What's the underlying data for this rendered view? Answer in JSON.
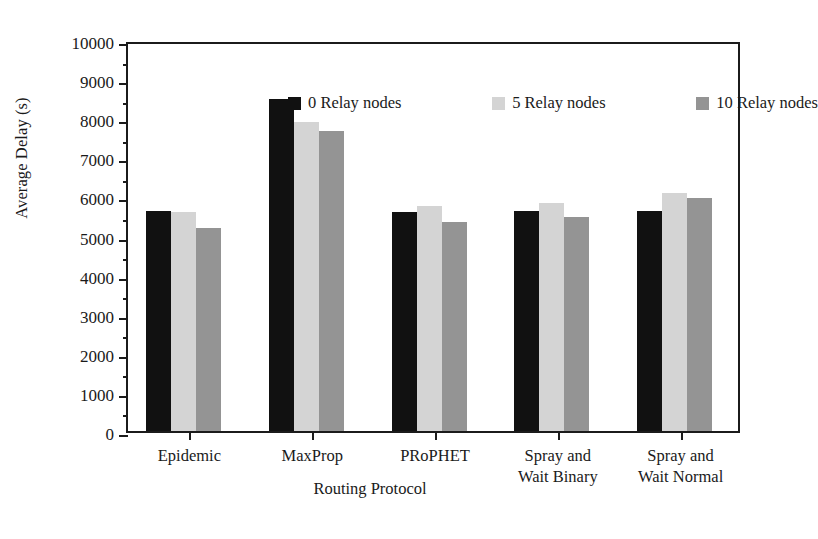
{
  "chart_data": {
    "type": "bar",
    "title": "",
    "xlabel": "Routing Protocol",
    "ylabel": "Average Delay (s)",
    "categories": [
      "Epidemic",
      "MaxProp",
      "PRoPHET",
      "Spray and\nWait Binary",
      "Spray and\nWait Normal"
    ],
    "series": [
      {
        "name": "0 Relay nodes",
        "color": "#111111",
        "values": [
          5620,
          8500,
          5600,
          5620,
          5620
        ]
      },
      {
        "name": "5 Relay nodes",
        "color": "#d4d4d4",
        "values": [
          5590,
          7900,
          5760,
          5840,
          6100
        ]
      },
      {
        "name": "10 Relay nodes",
        "color": "#949494",
        "values": [
          5200,
          7680,
          5340,
          5480,
          5950
        ]
      }
    ],
    "ylim": [
      0,
      10000
    ],
    "ytick_step": 1000,
    "yminor_step": 500,
    "ytick_labels": [
      "0",
      "1000",
      "2000",
      "3000",
      "4000",
      "5000",
      "6000",
      "7000",
      "8000",
      "9000",
      "10000"
    ],
    "grid": false,
    "legend_position": "top-inside"
  },
  "axes": {
    "y_title": "Average Delay (s)",
    "x_title": "Routing Protocol"
  },
  "legend": {
    "items": [
      {
        "label": "0 Relay nodes"
      },
      {
        "label": "5 Relay nodes"
      },
      {
        "label": "10 Relay nodes"
      }
    ]
  }
}
